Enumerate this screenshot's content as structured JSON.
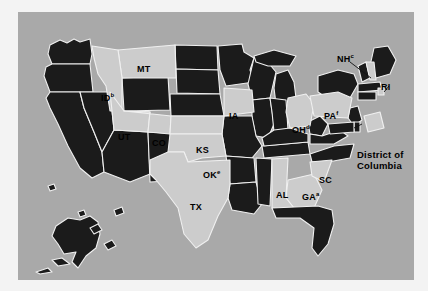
{
  "figure": {
    "top_clipped_text": "",
    "panel_background_color": "#a9a9a9",
    "page_background_color": "#f3f3f3"
  },
  "legend_colors": {
    "highlighted_state_fill": "#cccccc",
    "other_state_fill": "#1b1b1b",
    "state_border": "#f0f0f0",
    "leader_line": "#111111",
    "label_text": "#000000"
  },
  "map": {
    "title": "",
    "labels": [
      {
        "id": "MT",
        "text": "MT",
        "sup": "",
        "x": 119,
        "y": 52,
        "name": "state-label-mt"
      },
      {
        "id": "ID",
        "text": "ID",
        "sup": "b",
        "x": 83,
        "y": 81,
        "name": "state-label-id"
      },
      {
        "id": "UT",
        "text": "UT",
        "sup": "",
        "x": 100,
        "y": 120,
        "name": "state-label-ut"
      },
      {
        "id": "CO",
        "text": "CO",
        "sup": "",
        "x": 134,
        "y": 126,
        "name": "state-label-co"
      },
      {
        "id": "KS",
        "text": "KS",
        "sup": "",
        "x": 178,
        "y": 133,
        "name": "state-label-ks"
      },
      {
        "id": "OK",
        "text": "OK",
        "sup": "e",
        "x": 185,
        "y": 158,
        "name": "state-label-ok"
      },
      {
        "id": "TX",
        "text": "TX",
        "sup": "",
        "x": 172,
        "y": 190,
        "name": "state-label-tx"
      },
      {
        "id": "IA",
        "text": "IA",
        "sup": "",
        "x": 211,
        "y": 99,
        "name": "state-label-ia"
      },
      {
        "id": "OH",
        "text": "OH",
        "sup": "d",
        "x": 274,
        "y": 113,
        "name": "state-label-oh"
      },
      {
        "id": "PA",
        "text": "PA",
        "sup": "f",
        "x": 306,
        "y": 99,
        "name": "state-label-pa"
      },
      {
        "id": "NH",
        "text": "NH",
        "sup": "c",
        "x": 319,
        "y": 42,
        "name": "state-label-nh"
      },
      {
        "id": "RI",
        "text": "RI",
        "sup": "",
        "x": 363,
        "y": 70,
        "name": "state-label-ri"
      },
      {
        "id": "AL",
        "text": "AL",
        "sup": "",
        "x": 258,
        "y": 178,
        "name": "state-label-al"
      },
      {
        "id": "GA",
        "text": "GA",
        "sup": "a",
        "x": 284,
        "y": 180,
        "name": "state-label-ga"
      },
      {
        "id": "SC",
        "text": "SC",
        "sup": "",
        "x": 301,
        "y": 163,
        "name": "state-label-sc"
      }
    ],
    "callouts": [
      {
        "id": "DC",
        "line1": "District of",
        "line2": "Columbia",
        "x": 339,
        "y": 137,
        "name": "callout-district-of-columbia"
      }
    ],
    "highlighted_states": [
      "MT",
      "ID",
      "UT",
      "CO",
      "KS",
      "OK",
      "TX",
      "IA",
      "OH",
      "PA",
      "NH",
      "RI",
      "AL",
      "GA",
      "SC",
      "DC"
    ],
    "footnote_markers": {
      "GA": "a",
      "ID": "b",
      "NH": "c",
      "OH": "d",
      "OK": "e",
      "PA": "f"
    }
  }
}
